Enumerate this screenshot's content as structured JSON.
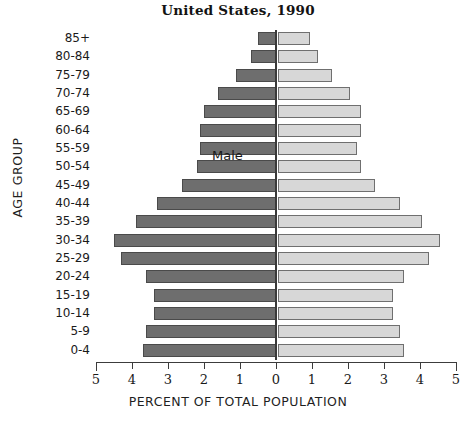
{
  "chart": {
    "title": "United States, 1990",
    "xlabel": "PERCENT OF TOTAL POPULATION",
    "ylabel": "AGE GROUP",
    "male_label": "Male",
    "female_label": "Female",
    "male_color": "#6e6e6e",
    "female_color": "#d7d7d7",
    "axis_color": "#3c3c3c"
  },
  "chart_data": {
    "type": "bar",
    "subtype": "population-pyramid",
    "title": "United States, 1990",
    "xlabel": "PERCENT OF TOTAL POPULATION",
    "ylabel": "AGE GROUP",
    "grid": false,
    "legend_position": "in-plot-annotations",
    "xlim": [
      -5,
      5
    ],
    "xticks": [
      5,
      4,
      3,
      2,
      1,
      0,
      1,
      2,
      3,
      4,
      5
    ],
    "xtick_labels": [
      "5",
      "4",
      "3",
      "2",
      "1",
      "0",
      "1",
      "2",
      "3",
      "4",
      "5"
    ],
    "categories": [
      "85+",
      "80-84",
      "75-79",
      "70-74",
      "65-69",
      "60-64",
      "55-59",
      "50-54",
      "45-49",
      "40-44",
      "35-39",
      "30-34",
      "25-29",
      "20-24",
      "15-19",
      "10-14",
      "5-9",
      "0-4"
    ],
    "series": [
      {
        "name": "Male",
        "direction": "left",
        "color": "#6e6e6e",
        "values": [
          0.5,
          0.7,
          1.1,
          1.6,
          2.0,
          2.1,
          2.1,
          2.2,
          2.6,
          3.3,
          3.9,
          4.5,
          4.3,
          3.6,
          3.4,
          3.4,
          3.6,
          3.7
        ]
      },
      {
        "name": "Female",
        "direction": "right",
        "color": "#d7d7d7",
        "values": [
          0.9,
          1.1,
          1.5,
          2.0,
          2.3,
          2.3,
          2.2,
          2.3,
          2.7,
          3.4,
          4.0,
          4.5,
          4.2,
          3.5,
          3.2,
          3.2,
          3.4,
          3.5
        ]
      }
    ]
  }
}
